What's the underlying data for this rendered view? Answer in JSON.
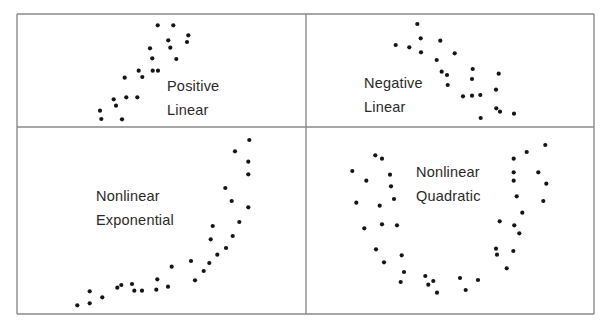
{
  "figure": {
    "border_color": "#8a8a8a",
    "dot_color": "#151515",
    "dot_radius": 2.1,
    "frame": {
      "left": 17,
      "top": 14,
      "right": 594,
      "bottom": 314,
      "mid_x": 306,
      "mid_y": 127
    }
  },
  "panels": [
    {
      "id": "positive-linear",
      "label_line1": "Positive",
      "label_line2": "Linear",
      "label_pos": {
        "x": 167,
        "y": 74
      },
      "points": [
        [
          157.7,
          25.3
        ],
        [
          173.3,
          25.3
        ],
        [
          188.3,
          35.3
        ],
        [
          187,
          42
        ],
        [
          168.3,
          40.3
        ],
        [
          170.3,
          47.7
        ],
        [
          150,
          48.3
        ],
        [
          152.3,
          58.3
        ],
        [
          176.3,
          59
        ],
        [
          138.7,
          70.7
        ],
        [
          152.7,
          70.7
        ],
        [
          158,
          70.7
        ],
        [
          142.3,
          77
        ],
        [
          124.7,
          77.7
        ],
        [
          113.7,
          99.3
        ],
        [
          126.3,
          97.3
        ],
        [
          137.3,
          97.3
        ],
        [
          116,
          105.7
        ],
        [
          100,
          110.7
        ],
        [
          101.3,
          119
        ],
        [
          122,
          119.3
        ]
      ]
    },
    {
      "id": "negative-linear",
      "label_line1": "Negative",
      "label_line2": "Linear",
      "label_pos": {
        "x": 364,
        "y": 71
      },
      "points": [
        [
          417.3,
          24
        ],
        [
          420.7,
          38.3
        ],
        [
          440.3,
          40.7
        ],
        [
          395.7,
          45
        ],
        [
          409.3,
          47.3
        ],
        [
          421,
          52.3
        ],
        [
          454.7,
          53.3
        ],
        [
          436.7,
          60
        ],
        [
          441.7,
          71.7
        ],
        [
          447,
          75
        ],
        [
          472.7,
          69
        ],
        [
          498.7,
          73.7
        ],
        [
          472,
          79
        ],
        [
          447.7,
          85
        ],
        [
          496,
          89.7
        ],
        [
          463,
          96.3
        ],
        [
          472,
          95.7
        ],
        [
          480.3,
          95
        ],
        [
          496.3,
          108.3
        ],
        [
          500,
          111.7
        ],
        [
          514,
          113.7
        ],
        [
          480.7,
          118
        ]
      ]
    },
    {
      "id": "nonlinear-exponential",
      "label_line1": "Nonlinear",
      "label_line2": "Exponential",
      "label_pos": {
        "x": 96,
        "y": 184
      },
      "points": [
        [
          249.3,
          140
        ],
        [
          235,
          151.3
        ],
        [
          248.3,
          161.7
        ],
        [
          248.3,
          174.3
        ],
        [
          225.3,
          188
        ],
        [
          231.7,
          201
        ],
        [
          248.3,
          207.3
        ],
        [
          212.7,
          226
        ],
        [
          239.3,
          222
        ],
        [
          232.7,
          236
        ],
        [
          210.7,
          239.3
        ],
        [
          226,
          248
        ],
        [
          217.3,
          254.7
        ],
        [
          191,
          261
        ],
        [
          209.3,
          263
        ],
        [
          171.7,
          266.7
        ],
        [
          203.7,
          271
        ],
        [
          157.3,
          279.3
        ],
        [
          195,
          280.3
        ],
        [
          132,
          284
        ],
        [
          121.3,
          285
        ],
        [
          117.3,
          287.7
        ],
        [
          168,
          286.7
        ],
        [
          134.3,
          290.7
        ],
        [
          142,
          290.7
        ],
        [
          156.3,
          289.7
        ],
        [
          89.7,
          291.3
        ],
        [
          102.3,
          297.3
        ],
        [
          89.7,
          303.3
        ],
        [
          77.3,
          305.3
        ]
      ]
    },
    {
      "id": "nonlinear-quadratic",
      "label_line1": "Nonlinear",
      "label_line2": "Quadratic",
      "label_pos": {
        "x": 416,
        "y": 160
      },
      "points": [
        [
          375.3,
          155.3
        ],
        [
          382,
          158.7
        ],
        [
          352.3,
          171
        ],
        [
          390,
          174.7
        ],
        [
          366.3,
          180.7
        ],
        [
          391,
          186.3
        ],
        [
          394,
          199
        ],
        [
          356.3,
          202.7
        ],
        [
          379.7,
          205.7
        ],
        [
          364.3,
          228.3
        ],
        [
          382,
          224.3
        ],
        [
          397,
          225.3
        ],
        [
          376,
          249.3
        ],
        [
          401.7,
          255.3
        ],
        [
          384,
          262.3
        ],
        [
          404,
          272
        ],
        [
          400.7,
          282
        ],
        [
          425.3,
          276
        ],
        [
          433.3,
          281
        ],
        [
          428.3,
          284.7
        ],
        [
          437,
          292.7
        ],
        [
          460,
          278
        ],
        [
          478,
          280
        ],
        [
          465.7,
          290
        ],
        [
          545.3,
          145
        ],
        [
          526.7,
          152
        ],
        [
          513.7,
          158.7
        ],
        [
          513.7,
          172.3
        ],
        [
          538.3,
          172.3
        ],
        [
          513.7,
          180.7
        ],
        [
          546.3,
          183.7
        ],
        [
          516.7,
          196.3
        ],
        [
          543.3,
          201
        ],
        [
          522.3,
          212.7
        ],
        [
          499.7,
          221.3
        ],
        [
          514.3,
          225.3
        ],
        [
          519.3,
          233.3
        ],
        [
          496,
          248.7
        ],
        [
          497,
          254.7
        ],
        [
          513.3,
          251
        ],
        [
          506.7,
          268.3
        ]
      ]
    }
  ]
}
